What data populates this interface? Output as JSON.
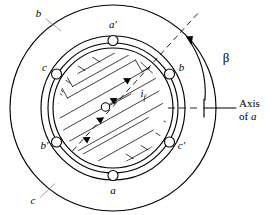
{
  "figure": {
    "domain": "diagram"
  },
  "stator": {
    "name": "stator",
    "slot_labels": {
      "top": "a′",
      "upper_right": "b",
      "lower_right": "c′",
      "bottom": "a",
      "lower_left": "b′",
      "upper_left": "c"
    },
    "phase_leader_labels": {
      "upper_left_outer": "b",
      "lower_left_outer": "c"
    }
  },
  "rotor": {
    "name": "rotor",
    "field_current_label": "i",
    "field_current_subscript": "f"
  },
  "angles": {
    "beta_symbol": "β",
    "axis_label_line1": "Axis",
    "axis_label_line2_prefix": "of ",
    "axis_label_line2_italic": "a"
  },
  "colors": {
    "ink": "#000000",
    "paper": "#ffffff",
    "leader": "#555555"
  }
}
